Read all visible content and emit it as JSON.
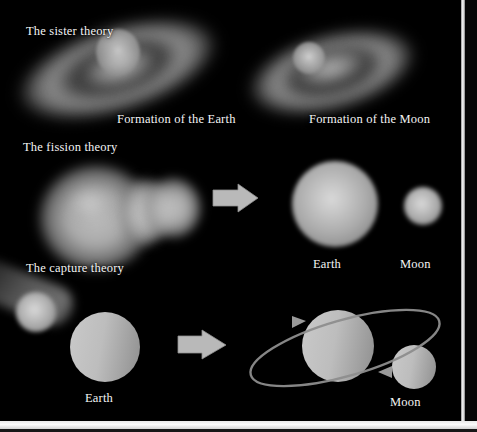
{
  "figure": {
    "background_color": "#000000",
    "text_color": "#f4f4f4",
    "accent_color": "#b4b4b4",
    "width": 477,
    "height": 432
  },
  "rows": [
    {
      "id": "sister-theory",
      "title": "The sister theory",
      "captions": [
        "Formation of the Earth",
        "Formation of the Moon"
      ]
    },
    {
      "id": "fission-theory",
      "title": "The fission theory",
      "captions": [
        "Earth",
        "Moon"
      ]
    },
    {
      "id": "capture-theory",
      "title": "The capture theory",
      "captions": [
        "Earth",
        "Moon"
      ]
    }
  ],
  "labels": {
    "sister_theory": "The sister theory",
    "fission_theory": "The fission theory",
    "capture_theory": "The capture theory",
    "formation_of_the_earth": "Formation of the Earth",
    "formation_of_the_moon": "Formation of the Moon",
    "earth_fission": "Earth",
    "moon_fission": "Moon",
    "earth_capture": "Earth",
    "moon_capture": "Moon"
  },
  "icons": {
    "arrow_fission": "right-block-arrow-icon",
    "arrow_capture": "right-block-arrow-icon",
    "orbit": "orbit-ellipse-icon",
    "orbit_arrow_left": "orbit-direction-arrowhead",
    "orbit_arrow_right": "orbit-direction-arrowhead"
  }
}
